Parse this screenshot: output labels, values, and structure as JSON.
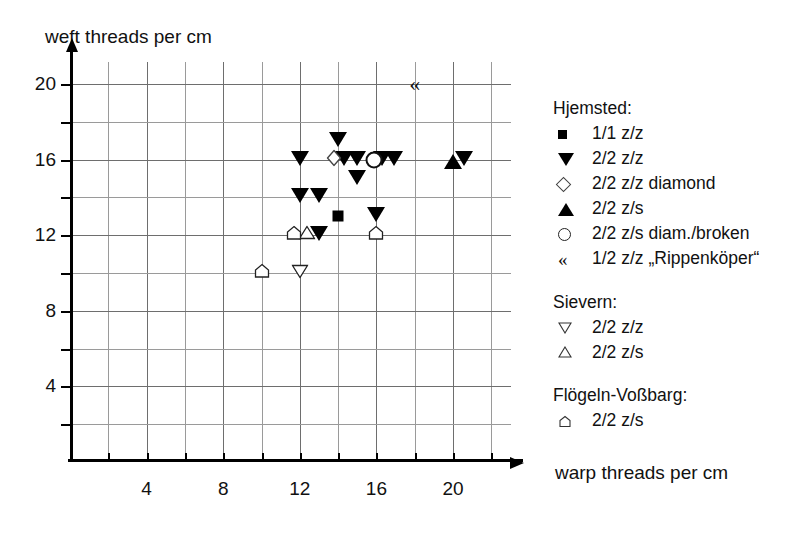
{
  "chart_data": {
    "type": "scatter",
    "title": "",
    "xlabel": "warp threads per cm",
    "ylabel": "weft threads per cm",
    "xlim": [
      0,
      23
    ],
    "ylim": [
      0,
      22
    ],
    "xticks": [
      4,
      8,
      12,
      16,
      20
    ],
    "yticks": [
      4,
      8,
      12,
      16,
      20
    ],
    "xtick_labels": [
      "4",
      "8",
      "12",
      "16",
      "20"
    ],
    "ytick_labels": [
      "4",
      "8",
      "12",
      "16",
      "20"
    ],
    "grid": true,
    "grid_minor_step": 2,
    "legend_position": "right",
    "series": [
      {
        "name": "1/1 z/z",
        "group": "Hjemsted",
        "marker": "filled-square",
        "points": [
          [
            14,
            13
          ]
        ]
      },
      {
        "name": "2/2 z/z",
        "group": "Hjemsted",
        "marker": "filled-triangle-down",
        "points": [
          [
            12,
            16
          ],
          [
            14,
            17
          ],
          [
            14.3,
            16
          ],
          [
            15,
            16
          ],
          [
            15,
            15
          ],
          [
            16.3,
            16
          ],
          [
            16.9,
            16
          ],
          [
            20.6,
            16
          ],
          [
            12,
            14
          ],
          [
            13,
            14
          ],
          [
            16,
            13
          ],
          [
            13,
            12
          ]
        ]
      },
      {
        "name": "2/2 z/z diamond",
        "group": "Hjemsted",
        "marker": "open-diamond",
        "points": [
          [
            13.8,
            16
          ]
        ]
      },
      {
        "name": "2/2 z/s",
        "group": "Hjemsted",
        "marker": "filled-triangle-up",
        "points": [
          [
            20,
            16
          ]
        ]
      },
      {
        "name": "2/2 z/s diam./broken",
        "group": "Hjemsted",
        "marker": "open-circle",
        "points": [
          [
            15.9,
            16
          ]
        ]
      },
      {
        "name": "1/2 z/z „Rippenköper“",
        "group": "Hjemsted",
        "marker": "guillemet",
        "points": [
          [
            18,
            20
          ]
        ]
      },
      {
        "name": "2/2 z/z",
        "group": "Sievern",
        "marker": "open-triangle-down",
        "points": [
          [
            12,
            10
          ]
        ]
      },
      {
        "name": "2/2 z/s",
        "group": "Sievern",
        "marker": "open-triangle-up",
        "points": [
          [
            12.4,
            12
          ]
        ]
      },
      {
        "name": "2/2 z/s",
        "group": "Flögeln-Voßbarg",
        "marker": "open-house",
        "points": [
          [
            11.7,
            12
          ],
          [
            16,
            12
          ],
          [
            10,
            10
          ]
        ]
      }
    ]
  },
  "axes": {
    "y_title": "weft threads per cm",
    "x_title": "warp threads per cm",
    "y_labels": [
      "20",
      "16",
      "12",
      "8",
      "4"
    ],
    "x_labels": [
      "4",
      "8",
      "12",
      "16",
      "20"
    ]
  },
  "legend": {
    "groups": [
      {
        "title": "Hjemsted:",
        "rows": [
          {
            "symbol": "filled-square",
            "label": "1/1 z/z"
          },
          {
            "symbol": "filled-triangle-down",
            "label": "2/2 z/z"
          },
          {
            "symbol": "open-diamond",
            "label": "2/2 z/z diamond"
          },
          {
            "symbol": "filled-triangle-up",
            "label": "2/2 z/s"
          },
          {
            "symbol": "open-circle",
            "label": "2/2 z/s diam./broken"
          },
          {
            "symbol": "guillemet",
            "label": "1/2 z/z „Rippenköper“"
          }
        ]
      },
      {
        "title": "Sievern:",
        "rows": [
          {
            "symbol": "open-triangle-down",
            "label": "2/2 z/z"
          },
          {
            "symbol": "open-triangle-up",
            "label": "2/2 z/s"
          }
        ]
      },
      {
        "title": "Flögeln-Voßbarg:",
        "rows": [
          {
            "symbol": "open-house",
            "label": "2/2 z/s"
          }
        ]
      }
    ]
  },
  "symbols": {
    "filled-square": "■",
    "filled-triangle-down": "▼",
    "filled-triangle-up": "▲",
    "open-diamond": "◇",
    "open-circle": "o",
    "guillemet": "«",
    "open-triangle-down": "▽",
    "open-triangle-up": "△",
    "open-house": "⌂"
  },
  "colors": {
    "ink": "#111111",
    "grid": "#9a9a9a",
    "background": "#ffffff"
  }
}
